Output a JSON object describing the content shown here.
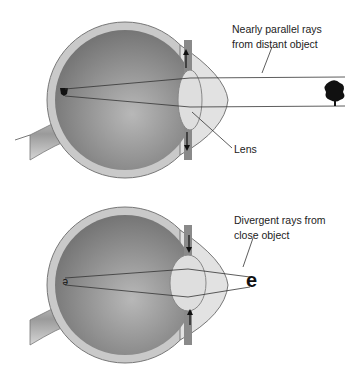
{
  "diagram": {
    "top_panel": {
      "label_rays": "Nearly parallel rays from distant object",
      "label_rays_line1": "Nearly parallel rays",
      "label_rays_line2": "from distant object",
      "label_lens": "Lens",
      "object": "tree",
      "lens_state": "flattened (pulled outward)"
    },
    "bottom_panel": {
      "label_rays_line1": "Divergent rays from",
      "label_rays_line2": "close object",
      "object_glyph": "e",
      "image_glyph": "ə",
      "lens_state": "rounded (pushed inward)"
    },
    "colors": {
      "eye_dark": "#6e6e6e",
      "eye_light": "#b5b5b5",
      "sclera": "#c8c8c8",
      "lens": "#dcdcdc",
      "line": "#333333"
    }
  }
}
